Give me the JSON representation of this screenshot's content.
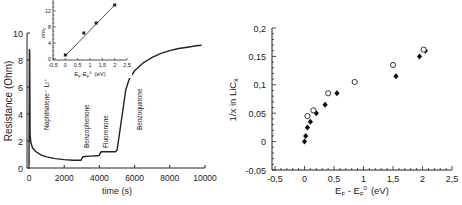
{
  "chart_data": [
    {
      "type": "line",
      "title": "",
      "xlabel": "time  (s)",
      "ylabel": "Resistance  (Ohm)",
      "xlim": [
        0,
        10000
      ],
      "ylim": [
        0,
        10
      ],
      "x_ticks": [
        "0",
        "2000",
        "4000",
        "6000",
        "8000",
        "10000"
      ],
      "y_ticks": [
        "0",
        "2",
        "4",
        "6",
        "8",
        "10"
      ],
      "grid": false,
      "series": [
        {
          "name": "Resistance",
          "x": [
            0,
            20,
            40,
            60,
            100,
            200,
            400,
            700,
            1000,
            1500,
            2000,
            2500,
            2950,
            3000,
            3050,
            3200,
            3500,
            3900,
            4000,
            4050,
            4100,
            4200,
            4500,
            4900,
            5000,
            5100,
            5300,
            5500,
            5700,
            6000,
            6500,
            7000,
            7500,
            8000,
            8500,
            9000,
            9500,
            9800
          ],
          "values": [
            0.2,
            8.8,
            8.6,
            2.5,
            1.9,
            1.5,
            1.2,
            0.95,
            0.82,
            0.7,
            0.62,
            0.58,
            0.58,
            0.7,
            0.82,
            0.85,
            0.88,
            0.9,
            0.95,
            1.1,
            1.2,
            1.2,
            1.2,
            1.2,
            1.3,
            2.2,
            4.0,
            5.8,
            6.6,
            7.2,
            7.8,
            8.2,
            8.5,
            8.7,
            8.85,
            8.95,
            9.05,
            9.1
          ]
        }
      ],
      "annotations": [
        {
          "text": "Naphthalene⁻ Li⁺",
          "x": 1500,
          "orientation": "vertical"
        },
        {
          "text": "Benzophenone",
          "x": 3100,
          "orientation": "vertical"
        },
        {
          "text": "Fluorenone",
          "x": 4200,
          "orientation": "vertical"
        },
        {
          "text": "Benzoquinone",
          "x": 6000,
          "orientation": "vertical"
        }
      ],
      "inset": {
        "type": "line",
        "xlabel": "E_F-E_F⁰ (eV)",
        "ylabel": "σ/σ₀",
        "xlim": [
          -0.5,
          2.5
        ],
        "ylim": [
          0,
          14
        ],
        "x_ticks": [
          "-0,5",
          "0",
          "0,5",
          "1",
          "1,5",
          "2",
          "2,5"
        ],
        "y_ticks": [
          "0",
          "4",
          "8",
          "12"
        ],
        "x": [
          0,
          0.75,
          1.25,
          2
        ],
        "values": [
          1,
          6.5,
          9,
          13.5
        ],
        "marker": "filled-square",
        "fit_line": true
      }
    },
    {
      "type": "scatter",
      "title": "",
      "xlabel": "E_F - E_F⁰  (eV)",
      "ylabel": "1/x  in  LiC_x",
      "xlim": [
        -0.5,
        2.5
      ],
      "ylim": [
        -0.05,
        0.2
      ],
      "x_ticks": [
        "-0,5",
        "0",
        "0,5",
        "1",
        "1,5",
        "2",
        "2,5"
      ],
      "y_ticks": [
        "-0,05",
        "0",
        "0,05",
        "0,1",
        "0,15",
        "0,2"
      ],
      "grid": false,
      "series": [
        {
          "name": "filled",
          "marker": "filled-diamond",
          "x": [
            0,
            0.02,
            0.05,
            0.1,
            0.2,
            0.35,
            0.55,
            1.55,
            1.95,
            2.05
          ],
          "values": [
            0,
            0.01,
            0.025,
            0.035,
            0.05,
            0.065,
            0.085,
            0.115,
            0.15,
            0.16
          ]
        },
        {
          "name": "open",
          "marker": "open-circle",
          "x": [
            0.05,
            0.15,
            0.4,
            0.85,
            1.5,
            2.02
          ],
          "values": [
            0.045,
            0.055,
            0.085,
            0.105,
            0.135,
            0.162
          ]
        }
      ]
    }
  ],
  "left_plot": {
    "xlabel": "time  (s)",
    "ylabel": "Resistance  (Ohm)",
    "x_ticks": [
      "0",
      "2000",
      "4000",
      "6000",
      "8000",
      "10000"
    ],
    "y_ticks": [
      "0",
      "2",
      "4",
      "6",
      "8",
      "10"
    ],
    "labels": {
      "naphthalene": "Naphthalene⁻ Li⁺",
      "benzophenone": "Benzophenone",
      "fluorenone": "Fluorenone",
      "benzoquinone": "Benzoquinone"
    },
    "inset": {
      "ylabel": "σ/σ₀",
      "xlabel_main": "E",
      "xlabel_sub1": "F",
      "xlabel_mid": "-E",
      "xlabel_sub2": "F",
      "xlabel_sup": "0",
      "xlabel_unit": "(eV)",
      "x_ticks": [
        "-0,5",
        "0",
        "0,5",
        "1",
        "1,5",
        "2",
        "2,5"
      ],
      "y_ticks": [
        "0",
        "4",
        "8",
        "12"
      ]
    }
  },
  "right_plot": {
    "xlabel_main": "E",
    "xlabel_sub1": "F",
    "xlabel_mid": " - E",
    "xlabel_sub2": "F",
    "xlabel_sup": "0",
    "xlabel_unit": "(eV)",
    "ylabel_main": "1/x  in  LiC",
    "ylabel_sub": "x",
    "x_ticks": [
      "-0,5",
      "0",
      "0,5",
      "1",
      "1,5",
      "2",
      "2,5"
    ],
    "y_ticks": [
      "-0,05",
      "0",
      "0,05",
      "0,1",
      "0,15",
      "0,2"
    ]
  }
}
